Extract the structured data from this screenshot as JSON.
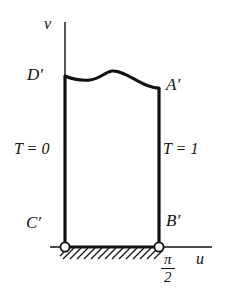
{
  "figure": {
    "kind": "math-diagram",
    "colors": {
      "stroke": "#111111",
      "background": "#ffffff",
      "node_fill": "#ffffff"
    },
    "axes": {
      "vertical_label": "v",
      "horizontal_label": "u",
      "origin_x": 65,
      "baseline_y": 247
    },
    "region": {
      "left_x": 65,
      "right_x": 159,
      "top_left_y": 76,
      "top_right_y": 88,
      "bottom_y": 247
    },
    "corner_labels": [
      {
        "name": "D-prime",
        "text": "D′",
        "x": 27,
        "y": 66
      },
      {
        "name": "A-prime",
        "text": "A′",
        "x": 166,
        "y": 76
      },
      {
        "name": "C-prime",
        "text": "C′",
        "x": 26,
        "y": 214
      },
      {
        "name": "B-prime",
        "text": "B′",
        "x": 166,
        "y": 212
      }
    ],
    "boundary_conditions": [
      {
        "name": "left-boundary-condition",
        "text": "T = 0"
      },
      {
        "name": "right-boundary-condition",
        "text": "T = 1"
      }
    ],
    "tick_label": {
      "name": "pi-over-two",
      "numerator": "π",
      "denominator": "2"
    },
    "nodes": [
      {
        "name": "node-c-prime",
        "cx": 65,
        "cy": 247,
        "r": 4.6
      },
      {
        "name": "node-b-prime",
        "cx": 159,
        "cy": 247,
        "r": 4.6
      }
    ],
    "hatching": {
      "name": "ground-hatching",
      "x_start": 60,
      "x_end": 161,
      "height": 12,
      "direction": "forward-slash"
    },
    "top_curve_path": "M 65 76 C 72 79, 80 81, 90 80 C 100 79, 105 72, 112 71 C 122 70, 134 80, 146 85 C 151 87, 155 88, 159 88"
  }
}
